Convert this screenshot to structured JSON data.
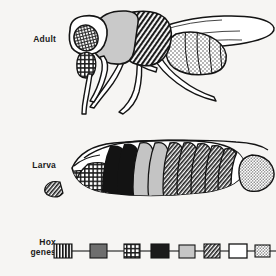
{
  "figure": {
    "background_color": "#f6f5f3",
    "ink_color": "#141414"
  },
  "panels": [
    {
      "id": "adult",
      "label": "Adult",
      "description": "Side view of an adult fruit fly (Drosophila melanogaster) with head, thorax, abdomen, wing and three pairs of legs",
      "regions": [
        {
          "name": "head-eye",
          "pattern": "fine-grid",
          "color": "#2b2b2b"
        },
        {
          "name": "maxillary-palp",
          "pattern": "coarse-grid",
          "color": "#3a3a3a"
        },
        {
          "name": "anterior-thorax",
          "pattern": "solid",
          "color": "#c9c9c9"
        },
        {
          "name": "posterior-thorax",
          "pattern": "diagonal-hatch",
          "color": "#262626"
        },
        {
          "name": "abdomen",
          "pattern": "stipple",
          "color": "#9a9a9a"
        },
        {
          "name": "wing",
          "pattern": "outline",
          "color": "#ffffff"
        },
        {
          "name": "legs",
          "pattern": "outline",
          "color": "#ffffff"
        }
      ]
    },
    {
      "id": "larva",
      "label": "Larva",
      "description": "Side view of a Drosophila larva showing segmented body with shaded segments corresponding to Hox gene expression domains",
      "segments": [
        {
          "index": 1,
          "pattern": "coarse-grid",
          "color": "#3a3a3a"
        },
        {
          "index": 2,
          "pattern": "coarse-grid",
          "color": "#3a3a3a"
        },
        {
          "index": 3,
          "pattern": "solid-dark",
          "color": "#131313"
        },
        {
          "index": 4,
          "pattern": "solid-dark",
          "color": "#131313"
        },
        {
          "index": 5,
          "pattern": "solid-light",
          "color": "#c4c4c4"
        },
        {
          "index": 6,
          "pattern": "solid-light",
          "color": "#c4c4c4"
        },
        {
          "index": 7,
          "pattern": "diagonal-hatch",
          "color": "#2a2a2a"
        },
        {
          "index": 8,
          "pattern": "diagonal-hatch",
          "color": "#2a2a2a"
        },
        {
          "index": 9,
          "pattern": "diagonal-hatch",
          "color": "#2a2a2a"
        },
        {
          "index": 10,
          "pattern": "diagonal-hatch",
          "color": "#2a2a2a"
        },
        {
          "index": 11,
          "pattern": "diagonal-hatch",
          "color": "#2a2a2a"
        },
        {
          "index": 12,
          "pattern": "white",
          "color": "#ffffff"
        },
        {
          "index": 13,
          "pattern": "white",
          "color": "#ffffff"
        },
        {
          "index": 14,
          "pattern": "stipple",
          "color": "#a8a8a8"
        }
      ]
    }
  ],
  "hox": {
    "label": "Hox\ngenes",
    "line_color": "#555555",
    "genes": [
      {
        "index": 0,
        "pattern": "vertical-stripes",
        "color": "#1c1c1c",
        "x": 62,
        "width": 18,
        "height": 13
      },
      {
        "index": 1,
        "pattern": "solid-gray",
        "color": "#6e6e6e",
        "x": 98,
        "width": 17,
        "height": 13
      },
      {
        "index": 2,
        "pattern": "coarse-grid",
        "color": "#3a3a3a",
        "x": 133,
        "width": 16,
        "height": 13
      },
      {
        "index": 3,
        "pattern": "solid-dark",
        "color": "#1b1b1b",
        "x": 160,
        "width": 17,
        "height": 13
      },
      {
        "index": 4,
        "pattern": "solid-light",
        "color": "#c6c6c6",
        "x": 187,
        "width": 16,
        "height": 13
      },
      {
        "index": 5,
        "pattern": "diagonal-hatch",
        "color": "#2a2a2a",
        "x": 213,
        "width": 16,
        "height": 13
      },
      {
        "index": 6,
        "pattern": "white",
        "color": "#ffffff",
        "x": 237,
        "width": 17,
        "height": 13
      },
      {
        "index": 7,
        "pattern": "stipple",
        "color": "#b0b0b0",
        "x": 262,
        "width": 15,
        "height": 12
      }
    ]
  }
}
